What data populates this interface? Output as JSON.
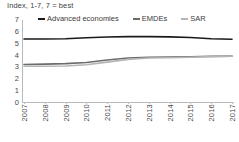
{
  "chart_data": {
    "type": "line",
    "title": "Index, 1-7, 7 = best",
    "xlabel": "",
    "ylabel": "",
    "ylim": [
      0,
      7
    ],
    "yticks": [
      "7",
      "6",
      "5",
      "4",
      "3",
      "2",
      "1",
      "0"
    ],
    "grid": false,
    "legend_position": "top",
    "categories": [
      "2007",
      "2008",
      "2009",
      "2010",
      "2011",
      "2012",
      "2013",
      "2014",
      "2015",
      "2016",
      "2017"
    ],
    "series": [
      {
        "name": "Advanced economies",
        "color": "#1a1a1a",
        "values": [
          5.4,
          5.4,
          5.42,
          5.5,
          5.57,
          5.6,
          5.6,
          5.58,
          5.52,
          5.42,
          5.38
        ]
      },
      {
        "name": "EMDEs",
        "color": "#6b6b6b",
        "values": [
          3.25,
          3.28,
          3.32,
          3.42,
          3.62,
          3.8,
          3.86,
          3.88,
          3.9,
          3.93,
          3.95
        ]
      },
      {
        "name": "SAR",
        "color": "#b5b5b5",
        "values": [
          3.1,
          3.1,
          3.12,
          3.22,
          3.45,
          3.68,
          3.8,
          3.82,
          3.86,
          3.92,
          3.95
        ]
      }
    ]
  },
  "legend": {
    "items": [
      {
        "label": "Advanced economies",
        "color": "#1a1a1a"
      },
      {
        "label": "EMDEs",
        "color": "#6b6b6b"
      },
      {
        "label": "SAR",
        "color": "#b5b5b5"
      }
    ]
  },
  "colors": {
    "advanced_economies": "#1a1a1a",
    "emdes": "#6b6b6b",
    "sar": "#b5b5b5",
    "axis": "#b9b9b9",
    "text": "#4a4a4a",
    "background": "#ffffff"
  }
}
